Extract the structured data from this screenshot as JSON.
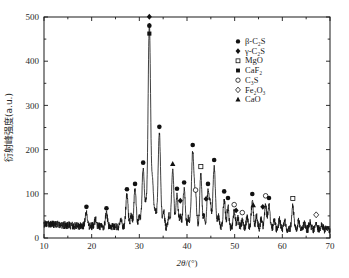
{
  "chart_data": {
    "type": "line",
    "title": "",
    "xlabel": "2θ/(°)",
    "ylabel": "衍射峰强度(a.u.)",
    "xlim": [
      10,
      70
    ],
    "ylim": [
      0,
      500
    ],
    "xticks": [
      10,
      20,
      30,
      40,
      50,
      60,
      70
    ],
    "yticks": [
      0,
      100,
      200,
      300,
      400,
      500
    ],
    "xminor_step": 5,
    "yminor_step": 50,
    "grid": false,
    "legend_position": "upper-right",
    "baseline_level": 25,
    "noise_amplitude": 9,
    "legend": [
      {
        "label": "β-C₂S",
        "marker": "filled-circle",
        "color": "#111111"
      },
      {
        "label": "γ-C₂S",
        "marker": "filled-diamond",
        "color": "#111111"
      },
      {
        "label": "MgO",
        "marker": "open-square",
        "color": "#111111"
      },
      {
        "label": "CaF₂",
        "marker": "filled-square",
        "color": "#111111"
      },
      {
        "label": "C₃S",
        "marker": "open-circle",
        "color": "#111111"
      },
      {
        "label": "Fe₂O₃",
        "marker": "open-diamond",
        "color": "#111111"
      },
      {
        "label": "CaO",
        "marker": "filled-triangle",
        "color": "#111111"
      }
    ],
    "peaks": [
      {
        "x": 18.9,
        "y": 58,
        "w": 0.22
      },
      {
        "x": 20.8,
        "y": 40,
        "w": 0.2
      },
      {
        "x": 23.1,
        "y": 55,
        "w": 0.22
      },
      {
        "x": 26.1,
        "y": 44,
        "w": 0.2
      },
      {
        "x": 27.4,
        "y": 98,
        "w": 0.24
      },
      {
        "x": 28.3,
        "y": 52,
        "w": 0.2
      },
      {
        "x": 29.1,
        "y": 110,
        "w": 0.24
      },
      {
        "x": 30.0,
        "y": 48,
        "w": 0.2
      },
      {
        "x": 30.8,
        "y": 158,
        "w": 0.24
      },
      {
        "x": 31.4,
        "y": 70,
        "w": 0.2
      },
      {
        "x": 32.1,
        "y": 488,
        "w": 0.26
      },
      {
        "x": 32.8,
        "y": 120,
        "w": 0.22
      },
      {
        "x": 33.4,
        "y": 60,
        "w": 0.2
      },
      {
        "x": 34.2,
        "y": 239,
        "w": 0.26
      },
      {
        "x": 35.1,
        "y": 62,
        "w": 0.2
      },
      {
        "x": 36.2,
        "y": 55,
        "w": 0.2
      },
      {
        "x": 37.0,
        "y": 155,
        "w": 0.24
      },
      {
        "x": 37.9,
        "y": 99,
        "w": 0.22
      },
      {
        "x": 38.6,
        "y": 52,
        "w": 0.2
      },
      {
        "x": 39.4,
        "y": 113,
        "w": 0.24
      },
      {
        "x": 40.3,
        "y": 48,
        "w": 0.2
      },
      {
        "x": 41.2,
        "y": 198,
        "w": 0.26
      },
      {
        "x": 41.8,
        "y": 96,
        "w": 0.22
      },
      {
        "x": 42.9,
        "y": 149,
        "w": 0.22
      },
      {
        "x": 43.6,
        "y": 54,
        "w": 0.2
      },
      {
        "x": 44.4,
        "y": 110,
        "w": 0.22
      },
      {
        "x": 44.9,
        "y": 78,
        "w": 0.2
      },
      {
        "x": 45.7,
        "y": 164,
        "w": 0.26
      },
      {
        "x": 46.6,
        "y": 52,
        "w": 0.2
      },
      {
        "x": 47.8,
        "y": 93,
        "w": 0.22
      },
      {
        "x": 48.6,
        "y": 78,
        "w": 0.2
      },
      {
        "x": 49.9,
        "y": 63,
        "w": 0.22
      },
      {
        "x": 50.7,
        "y": 50,
        "w": 0.2
      },
      {
        "x": 51.6,
        "y": 45,
        "w": 0.2
      },
      {
        "x": 52.6,
        "y": 50,
        "w": 0.2
      },
      {
        "x": 53.7,
        "y": 87,
        "w": 0.22
      },
      {
        "x": 54.6,
        "y": 55,
        "w": 0.2
      },
      {
        "x": 55.6,
        "y": 48,
        "w": 0.2
      },
      {
        "x": 56.5,
        "y": 80,
        "w": 0.22
      },
      {
        "x": 57.2,
        "y": 78,
        "w": 0.22
      },
      {
        "x": 58.3,
        "y": 44,
        "w": 0.2
      },
      {
        "x": 59.4,
        "y": 46,
        "w": 0.2
      },
      {
        "x": 60.5,
        "y": 42,
        "w": 0.2
      },
      {
        "x": 62.2,
        "y": 77,
        "w": 0.22
      },
      {
        "x": 63.4,
        "y": 44,
        "w": 0.2
      },
      {
        "x": 64.6,
        "y": 40,
        "w": 0.2
      },
      {
        "x": 65.8,
        "y": 42,
        "w": 0.2
      },
      {
        "x": 67.1,
        "y": 40,
        "w": 0.2
      },
      {
        "x": 68.3,
        "y": 36,
        "w": 0.2
      }
    ],
    "annotations": [
      {
        "x": 18.9,
        "y": 58,
        "marker": "filled-circle",
        "phase": "β-C₂S"
      },
      {
        "x": 23.1,
        "y": 55,
        "marker": "filled-circle",
        "phase": "β-C₂S"
      },
      {
        "x": 27.4,
        "y": 98,
        "marker": "filled-circle",
        "phase": "β-C₂S"
      },
      {
        "x": 29.1,
        "y": 110,
        "marker": "filled-circle",
        "phase": "β-C₂S"
      },
      {
        "x": 30.8,
        "y": 158,
        "marker": "filled-circle",
        "phase": "β-C₂S"
      },
      {
        "x": 32.1,
        "y": 488,
        "marker": "filled-diamond",
        "phase": "γ-C₂S"
      },
      {
        "x": 32.1,
        "y": 468,
        "marker": "filled-circle",
        "phase": "β-C₂S"
      },
      {
        "x": 32.1,
        "y": 450,
        "marker": "filled-square",
        "phase": "CaF₂"
      },
      {
        "x": 34.2,
        "y": 239,
        "marker": "filled-circle",
        "phase": "β-C₂S"
      },
      {
        "x": 37.0,
        "y": 155,
        "marker": "filled-triangle",
        "phase": "CaO"
      },
      {
        "x": 37.9,
        "y": 99,
        "marker": "filled-circle",
        "phase": "β-C₂S"
      },
      {
        "x": 38.6,
        "y": 72,
        "marker": "filled-diamond",
        "phase": "γ-C₂S"
      },
      {
        "x": 39.4,
        "y": 113,
        "marker": "filled-circle",
        "phase": "β-C₂S"
      },
      {
        "x": 41.2,
        "y": 198,
        "marker": "filled-circle",
        "phase": "β-C₂S"
      },
      {
        "x": 41.8,
        "y": 96,
        "marker": "open-circle",
        "phase": "C₃S"
      },
      {
        "x": 42.9,
        "y": 149,
        "marker": "open-square",
        "phase": "MgO"
      },
      {
        "x": 44.4,
        "y": 110,
        "marker": "filled-circle",
        "phase": "β-C₂S"
      },
      {
        "x": 44.0,
        "y": 76,
        "marker": "filled-diamond",
        "phase": "γ-C₂S"
      },
      {
        "x": 45.7,
        "y": 164,
        "marker": "filled-circle",
        "phase": "β-C₂S"
      },
      {
        "x": 47.8,
        "y": 93,
        "marker": "filled-circle",
        "phase": "β-C₂S"
      },
      {
        "x": 48.6,
        "y": 78,
        "marker": "filled-circle",
        "phase": "β-C₂S"
      },
      {
        "x": 49.9,
        "y": 63,
        "marker": "open-circle",
        "phase": "C₃S"
      },
      {
        "x": 50.3,
        "y": 50,
        "marker": "filled-diamond",
        "phase": "γ-C₂S"
      },
      {
        "x": 51.6,
        "y": 45,
        "marker": "open-circle",
        "phase": "C₃S"
      },
      {
        "x": 53.7,
        "y": 87,
        "marker": "filled-circle",
        "phase": "β-C₂S"
      },
      {
        "x": 53.9,
        "y": 62,
        "marker": "filled-triangle",
        "phase": "CaO"
      },
      {
        "x": 56.5,
        "y": 83,
        "marker": "open-circle",
        "phase": "C₃S"
      },
      {
        "x": 57.2,
        "y": 78,
        "marker": "filled-circle",
        "phase": "β-C₂S"
      },
      {
        "x": 55.9,
        "y": 58,
        "marker": "filled-diamond",
        "phase": "γ-C₂S"
      },
      {
        "x": 62.2,
        "y": 77,
        "marker": "open-square",
        "phase": "MgO"
      },
      {
        "x": 67.1,
        "y": 40,
        "marker": "open-diamond",
        "phase": "Fe₂O₃"
      }
    ]
  }
}
